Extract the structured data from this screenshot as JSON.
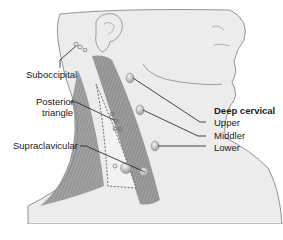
{
  "figure": {
    "colors": {
      "skin": "#ececec",
      "outline": "#6e6e6e",
      "muscle": "#8a8a8a",
      "muscle_stripe": "#5f5f5f",
      "node_fill": "#bdbdbd",
      "leader_line": "#1a1a1a"
    }
  },
  "labels": {
    "suboccipital": "Suboccipital",
    "posterior_triangle_line1": "Posterior",
    "posterior_triangle_line2": "triangle",
    "supraclavicular": "Supraclavicular",
    "deep_cervical_heading": "Deep cervical",
    "deep_cervical_upper": "Upper",
    "deep_cervical_middle": "Middler",
    "deep_cervical_lower": "Lower"
  }
}
